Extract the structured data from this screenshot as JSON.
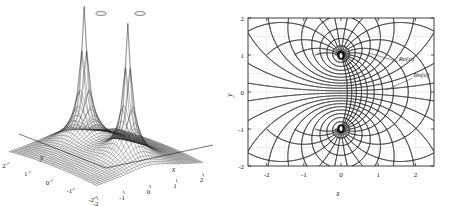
{
  "figure": {
    "background": "#ffffff",
    "width": 452,
    "height": 206,
    "ink_color": "#1a1a1a",
    "grid_color": "#b0b0b0"
  },
  "chart_data": [
    {
      "id": "surface-plot",
      "type": "surface",
      "title": "",
      "xlabel": "x",
      "ylabel": "y",
      "zlabel": "",
      "xlim": [
        -2,
        2
      ],
      "ylim": [
        -2,
        2
      ],
      "xticks": [
        -2,
        -1,
        0,
        1,
        2
      ],
      "yticks": [
        2,
        1,
        0,
        -1,
        -2
      ],
      "xtick_labels": [
        "-2",
        "-1",
        "0",
        "1",
        "2"
      ],
      "ytick_labels": [
        "2",
        "1",
        "0",
        "-1",
        "-2"
      ],
      "grid": false,
      "legend": "none",
      "description": "Mesh surface of |u| with two tall truncated singular spikes at (0,1) and (0,-1)",
      "singularities": [
        {
          "x": 0,
          "y": 1
        },
        {
          "x": 0,
          "y": -1
        }
      ],
      "mesh": {
        "nx": 41,
        "ny": 41,
        "style": "wireframe",
        "color": "#1a1a1a"
      },
      "zclip": "spikes truncated at top of box"
    },
    {
      "id": "contour-plot",
      "type": "contour",
      "title": "",
      "xlabel": "x",
      "ylabel": "y",
      "xlim": [
        -2.5,
        2.5
      ],
      "ylim": [
        -2,
        2
      ],
      "xticks": [
        -2,
        -1,
        0,
        1,
        2
      ],
      "yticks": [
        -2,
        -1,
        0,
        1,
        2
      ],
      "xtick_labels": [
        "-2",
        "-1",
        "0",
        "1",
        "2"
      ],
      "ytick_labels": [
        "-2",
        "-1",
        "0",
        "1",
        "2"
      ],
      "grid": true,
      "grid_style": "dotted",
      "grid_spacing": 0.5,
      "legend": "annotations",
      "annotations": [
        {
          "text": "Re(u)",
          "x": 1.55,
          "y": 0.85,
          "leader_to_x": 0.75,
          "leader_to_y": 1.05
        },
        {
          "text": "Im(u)",
          "x": 1.95,
          "y": 0.4,
          "leader_to_x": 1.2,
          "leader_to_y": 0.05
        }
      ],
      "poles": [
        {
          "x": 0,
          "y": 1
        },
        {
          "x": 0,
          "y": -1
        }
      ],
      "saddle": {
        "x": 0,
        "y": 0
      },
      "series": [
        {
          "name": "Re(u)",
          "kind": "equipotential",
          "color": "#1a1a1a",
          "levels": 26
        },
        {
          "name": "Im(u)",
          "kind": "streamline",
          "color": "#1a1a1a",
          "levels": 26
        }
      ],
      "description": "Orthogonal families of level curves of the real and imaginary parts of a two-pole (dipole pair) complex potential, dense near the poles at (0,+1) and (0,-1)"
    }
  ]
}
